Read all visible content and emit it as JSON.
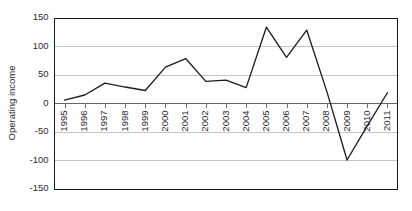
{
  "chart_data": {
    "type": "line",
    "title": "",
    "xlabel": "",
    "ylabel": "Operating income",
    "ylim": [
      -150,
      150
    ],
    "ytick_values": [
      150,
      100,
      50,
      0,
      -50,
      -100,
      -150
    ],
    "ytick_labels": [
      "150",
      "100",
      "50",
      "0",
      "-50",
      "-100",
      "-150"
    ],
    "grid": true,
    "legend": "none",
    "categories": [
      "1995",
      "1996",
      "1997",
      "1998",
      "1999",
      "2000",
      "2001",
      "2002",
      "2003",
      "2004",
      "2005",
      "2006",
      "2007",
      "2008",
      "2009",
      "2010",
      "2011"
    ],
    "series": [
      {
        "name": "Operating income",
        "color": "#1f1f1f",
        "values": [
          5,
          14,
          35,
          28,
          22,
          63,
          78,
          38,
          40,
          27,
          133,
          80,
          128,
          20,
          -100,
          -40,
          18
        ]
      }
    ]
  },
  "axis": {
    "y_title": "Operating income",
    "gridline_color": "#b8b8b8",
    "frame_color": "#1a1a1a",
    "line_color": "#1f1f1f"
  }
}
